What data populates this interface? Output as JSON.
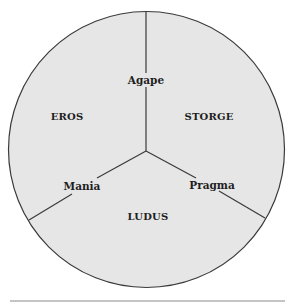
{
  "diagram": {
    "title": "",
    "colors": {
      "fill": "#e6e6e6",
      "stroke": "#3a3a3a",
      "text": "#1e1e1e",
      "rule": "#8a8a8a"
    },
    "regions": [
      {
        "id": "eros",
        "label": "EROS"
      },
      {
        "id": "storge",
        "label": "STORGE"
      },
      {
        "id": "ludus",
        "label": "LUDUS"
      }
    ],
    "boundaries": [
      {
        "id": "agape",
        "label": "Agape",
        "between": [
          "EROS",
          "STORGE"
        ]
      },
      {
        "id": "mania",
        "label": "Mania",
        "between": [
          "EROS",
          "LUDUS"
        ]
      },
      {
        "id": "pragma",
        "label": "Pragma",
        "between": [
          "STORGE",
          "LUDUS"
        ]
      }
    ]
  }
}
